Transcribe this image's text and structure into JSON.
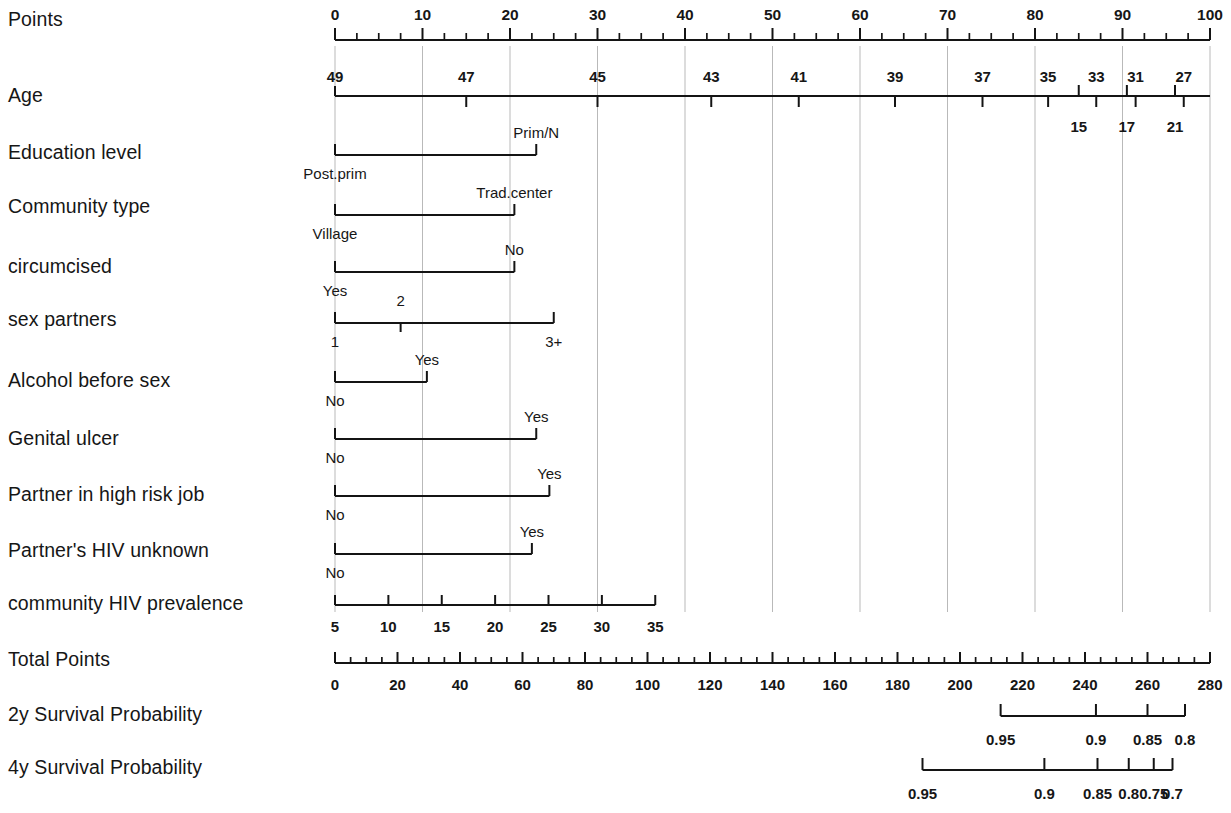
{
  "figure": {
    "type": "nomogram",
    "background": "#ffffff",
    "ink_color": "#161616",
    "grid_color": "#b9b9b9"
  },
  "rows": [
    {
      "id": "points",
      "label": "Points",
      "scale": "points",
      "tick_labels": [
        "0",
        "10",
        "20",
        "30",
        "40",
        "50",
        "60",
        "70",
        "80",
        "90",
        "100"
      ],
      "tick_values": [
        0,
        10,
        20,
        30,
        40,
        50,
        60,
        70,
        80,
        90,
        100
      ],
      "label_position": "above",
      "minor_step": 2.5
    },
    {
      "id": "age",
      "label": "Age",
      "scale": "points",
      "tick_labels_above": [
        "49",
        "47",
        "45",
        "43",
        "41",
        "39",
        "37",
        "35",
        "33",
        "31",
        "27"
      ],
      "tick_values_above": [
        0,
        15,
        30,
        43,
        53,
        64,
        74,
        81.5,
        87,
        91.5,
        97
      ],
      "tick_labels_below": [
        "15",
        "17",
        "21"
      ],
      "tick_values_below": [
        85,
        90.5,
        96
      ],
      "label_position": "above-and-below"
    },
    {
      "id": "education-level",
      "label": "Education level",
      "scale": "points",
      "categories": [
        {
          "label": "Post.prim",
          "value": 0,
          "label_position": "below"
        },
        {
          "label": "Prim/N",
          "value": 23,
          "label_position": "above"
        }
      ]
    },
    {
      "id": "community-type",
      "label": "Community type",
      "scale": "points",
      "categories": [
        {
          "label": "Village",
          "value": 0,
          "label_position": "below"
        },
        {
          "label": "Trad.center",
          "value": 20.5,
          "label_position": "above"
        }
      ]
    },
    {
      "id": "circumcised",
      "label": "circumcised",
      "scale": "points",
      "categories": [
        {
          "label": "Yes",
          "value": 0,
          "label_position": "below"
        },
        {
          "label": "No",
          "value": 20.5,
          "label_position": "above"
        }
      ]
    },
    {
      "id": "sex-partners",
      "label": "sex partners",
      "scale": "points",
      "categories": [
        {
          "label": "1",
          "value": 0,
          "label_position": "below"
        },
        {
          "label": "2",
          "value": 7.5,
          "label_position": "above"
        },
        {
          "label": "3+",
          "value": 25,
          "label_position": "below"
        }
      ]
    },
    {
      "id": "alcohol-before-sex",
      "label": "Alcohol before sex",
      "scale": "points",
      "categories": [
        {
          "label": "No",
          "value": 0,
          "label_position": "below"
        },
        {
          "label": "Yes",
          "value": 10.5,
          "label_position": "above"
        }
      ]
    },
    {
      "id": "genital-ulcer",
      "label": "Genital ulcer",
      "scale": "points",
      "categories": [
        {
          "label": "No",
          "value": 0,
          "label_position": "below"
        },
        {
          "label": "Yes",
          "value": 23,
          "label_position": "above"
        }
      ]
    },
    {
      "id": "partner-high-risk-job",
      "label": "Partner in high risk job",
      "scale": "points",
      "categories": [
        {
          "label": "No",
          "value": 0,
          "label_position": "below"
        },
        {
          "label": "Yes",
          "value": 24.5,
          "label_position": "above"
        }
      ]
    },
    {
      "id": "partner-hiv-unknown",
      "label": "Partner's HIV unknown",
      "scale": "points",
      "categories": [
        {
          "label": "No",
          "value": 0,
          "label_position": "below"
        },
        {
          "label": "Yes",
          "value": 22.5,
          "label_position": "above"
        }
      ]
    },
    {
      "id": "community-hiv-prevalence",
      "label": "community HIV prevalence",
      "scale": "points",
      "tick_labels": [
        "5",
        "10",
        "15",
        "20",
        "25",
        "30",
        "35"
      ],
      "tick_values": [
        0,
        6.1,
        12.2,
        18.3,
        24.4,
        30.5,
        36.6
      ],
      "label_position": "below"
    },
    {
      "id": "total-points",
      "label": "Total Points",
      "scale": "total",
      "tick_labels": [
        "0",
        "20",
        "40",
        "60",
        "80",
        "100",
        "120",
        "140",
        "160",
        "180",
        "200",
        "220",
        "240",
        "260",
        "280"
      ],
      "tick_values": [
        0,
        20,
        40,
        60,
        80,
        100,
        120,
        140,
        160,
        180,
        200,
        220,
        240,
        260,
        280
      ],
      "label_position": "below",
      "minor_step": 5
    },
    {
      "id": "2y-survival-probability",
      "label": "2y Survival Probability",
      "scale": "total",
      "tick_labels": [
        "0.95",
        "0.9",
        "0.85",
        "0.8"
      ],
      "tick_values": [
        213,
        243.5,
        260,
        272
      ],
      "label_position": "below"
    },
    {
      "id": "4y-survival-probability",
      "label": "4y Survival Probability",
      "scale": "total",
      "tick_labels": [
        "0.95",
        "0.9",
        "0.85",
        "0.8",
        "0.75",
        "0.7"
      ],
      "tick_values": [
        188,
        227,
        244,
        254,
        262,
        268
      ],
      "label_position": "below"
    }
  ],
  "axes": {
    "points": {
      "min": 0,
      "max": 100,
      "x_left_px": 335,
      "x_right_px": 1210
    },
    "total": {
      "min": 0,
      "max": 280,
      "x_left_px": 335,
      "x_right_px": 1210
    }
  },
  "chart_data": {
    "type": "nomogram",
    "title": "",
    "xlabel": "Points",
    "ylabel": "",
    "points_axis": [
      0,
      100
    ],
    "total_points_axis": [
      0,
      280
    ],
    "predictors": [
      {
        "name": "Age",
        "type": "continuous",
        "values": [
          49,
          47,
          45,
          43,
          41,
          39,
          37,
          35,
          33,
          31,
          27,
          15,
          17,
          21
        ],
        "points": [
          0,
          15,
          30,
          43,
          53,
          64,
          74,
          81.5,
          87,
          91.5,
          97,
          85,
          90.5,
          96
        ]
      },
      {
        "name": "Education level",
        "type": "categorical",
        "levels": [
          "Post.prim",
          "Prim/N"
        ],
        "points": [
          0,
          23
        ]
      },
      {
        "name": "Community type",
        "type": "categorical",
        "levels": [
          "Village",
          "Trad.center"
        ],
        "points": [
          0,
          20.5
        ]
      },
      {
        "name": "circumcised",
        "type": "categorical",
        "levels": [
          "Yes",
          "No"
        ],
        "points": [
          0,
          20.5
        ]
      },
      {
        "name": "sex partners",
        "type": "categorical",
        "levels": [
          "1",
          "2",
          "3+"
        ],
        "points": [
          0,
          7.5,
          25
        ]
      },
      {
        "name": "Alcohol before sex",
        "type": "categorical",
        "levels": [
          "No",
          "Yes"
        ],
        "points": [
          0,
          10.5
        ]
      },
      {
        "name": "Genital ulcer",
        "type": "categorical",
        "levels": [
          "No",
          "Yes"
        ],
        "points": [
          0,
          23
        ]
      },
      {
        "name": "Partner in high risk job",
        "type": "categorical",
        "levels": [
          "No",
          "Yes"
        ],
        "points": [
          0,
          24.5
        ]
      },
      {
        "name": "Partner's HIV unknown",
        "type": "categorical",
        "levels": [
          "No",
          "Yes"
        ],
        "points": [
          0,
          22.5
        ]
      },
      {
        "name": "community HIV prevalence",
        "type": "continuous",
        "values": [
          5,
          10,
          15,
          20,
          25,
          30,
          35
        ],
        "points": [
          0,
          6.1,
          12.2,
          18.3,
          24.4,
          30.5,
          36.6
        ]
      }
    ],
    "outcomes": [
      {
        "name": "2y Survival Probability",
        "labels": [
          "0.95",
          "0.9",
          "0.85",
          "0.8"
        ],
        "total_points": [
          213,
          243.5,
          260,
          272
        ]
      },
      {
        "name": "4y Survival Probability",
        "labels": [
          "0.95",
          "0.9",
          "0.85",
          "0.8",
          "0.75",
          "0.7"
        ],
        "total_points": [
          188,
          227,
          244,
          254,
          262,
          268
        ]
      }
    ]
  }
}
